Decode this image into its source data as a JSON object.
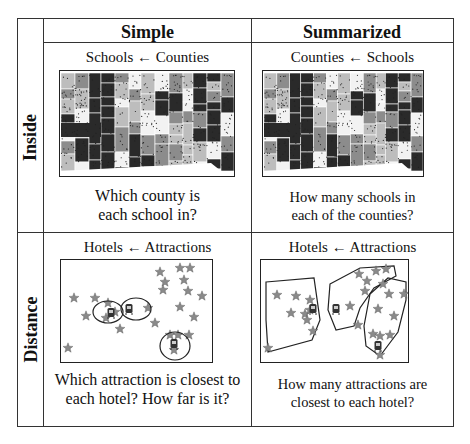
{
  "columns": [
    "Simple",
    "Summarized"
  ],
  "rows": [
    "Inside",
    "Distance"
  ],
  "cells": {
    "inside_simple": {
      "caption": "Schools ← Counties",
      "question_line1": "Which county is",
      "question_line2": "each school in?",
      "figure": "county-map-with-school-points"
    },
    "inside_summarized": {
      "caption": "Counties ← Schools",
      "question_line1": "How many schools in",
      "question_line2": "each of the counties?",
      "figure": "county-map-with-school-points"
    },
    "distance_simple": {
      "caption": "Hotels ← Attractions",
      "question_line1": "Which attraction is closest to",
      "question_line2": "each hotel?  How far is it?",
      "figure": "hotels-attractions-nearest"
    },
    "distance_summarized": {
      "caption": "Hotels ← Attractions",
      "question_line1": "How many attractions are",
      "question_line2": "closest to each hotel?",
      "figure": "hotels-attractions-regions"
    }
  },
  "icons": {
    "attraction": "star-icon",
    "hotel": "hotel-icon"
  },
  "colors": {
    "border": "#333333",
    "star": "#8a8a8a",
    "map_dark": "#2a2a2a",
    "map_mid": "#8c8c8c",
    "map_light": "#bdbdbd",
    "map_white": "#f2f2f2"
  }
}
